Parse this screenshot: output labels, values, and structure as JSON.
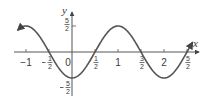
{
  "chart_data": {
    "type": "line",
    "title": "",
    "function": "y = -(5/2) cos(pi x)",
    "xlabel": "x",
    "ylabel": "y",
    "xlim": [
      -1.2,
      2.7
    ],
    "ylim": [
      -2.5,
      2.5
    ],
    "grid": false,
    "legend": null,
    "x_ticks": [
      {
        "value": -1,
        "label": "−1"
      },
      {
        "value": -0.5,
        "label_num": "1",
        "label_den": "2",
        "neg": true
      },
      {
        "value": 0,
        "label": "0"
      },
      {
        "value": 0.5,
        "label_num": "1",
        "label_den": "2",
        "neg": false
      },
      {
        "value": 1,
        "label": "1"
      },
      {
        "value": 1.5,
        "label_num": "3",
        "label_den": "2",
        "neg": false
      },
      {
        "value": 2,
        "label": "2"
      },
      {
        "value": 2.5,
        "label_num": "5",
        "label_den": "2",
        "neg": false
      }
    ],
    "y_ticks": [
      {
        "value": 2.5,
        "label_num": "5",
        "label_den": "2",
        "neg": false
      },
      {
        "value": -2.5,
        "label_num": "5",
        "label_den": "2",
        "neg": true
      }
    ],
    "series": [
      {
        "name": "curve",
        "x": [
          -1,
          -0.5,
          0,
          0.5,
          1,
          1.5,
          2,
          2.5
        ],
        "values": [
          2.5,
          0,
          -2.5,
          0,
          2.5,
          0,
          -2.5,
          0
        ]
      }
    ],
    "color": "#555555"
  },
  "labels": {
    "x_axis": "x",
    "y_axis": "y",
    "minus": "−"
  }
}
